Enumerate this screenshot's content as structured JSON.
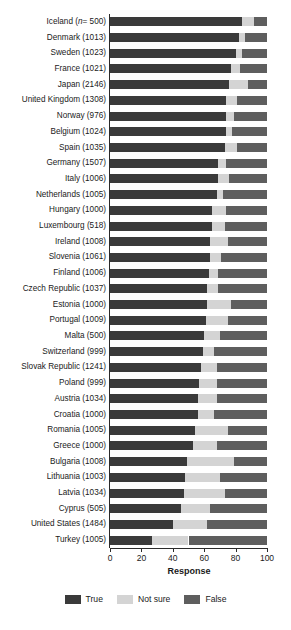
{
  "chart_data": {
    "type": "bar",
    "subtype": "stacked-horizontal-100pct",
    "title": "",
    "xlabel": "Response",
    "ylabel": "",
    "xlim": [
      0,
      100
    ],
    "xticks": [
      "0",
      "20",
      "40",
      "60",
      "80",
      "100"
    ],
    "grid": false,
    "legend_position": "bottom",
    "orientation": "horizontal",
    "series": [
      {
        "name": "True",
        "key": "true",
        "color": "#3a3a3a"
      },
      {
        "name": "Not sure",
        "key": "not_sure",
        "color": "#d4d4d4"
      },
      {
        "name": "False",
        "key": "false",
        "color": "#5e5e5e"
      }
    ],
    "categories": [
      "Iceland (n= 500)",
      "Denmark (1013)",
      "Sweden (1023)",
      "France (1021)",
      "Japan (2146)",
      "United Kingdom (1308)",
      "Norway (976)",
      "Belgium (1024)",
      "Spain (1035)",
      "Germany (1507)",
      "Italy (1006)",
      "Netherlands (1005)",
      "Hungary (1000)",
      "Luxembourg (518)",
      "Ireland (1008)",
      "Slovenia (1061)",
      "Finland (1006)",
      "Czech Republic (1037)",
      "Estonia (1000)",
      "Portugal (1009)",
      "Malta (500)",
      "Switzerland (999)",
      "Slovak Republic (1241)",
      "Poland (999)",
      "Austria (1034)",
      "Croatia (1000)",
      "Romania (1005)",
      "Greece (1000)",
      "Bulgaria (1008)",
      "Lithuania (1003)",
      "Latvia (1034)",
      "Cyprus (505)",
      "United States (1484)",
      "Turkey (1005)"
    ],
    "rows": [
      {
        "label": "Iceland (n= 500)",
        "country": "Iceland",
        "n": "500",
        "true": 84,
        "not_sure": 8,
        "false": 8
      },
      {
        "label": "Denmark (1013)",
        "country": "Denmark",
        "n": "1013",
        "true": 82,
        "not_sure": 4,
        "false": 14
      },
      {
        "label": "Sweden (1023)",
        "country": "Sweden",
        "n": "1023",
        "true": 80,
        "not_sure": 4,
        "false": 16
      },
      {
        "label": "France (1021)",
        "country": "France",
        "n": "1021",
        "true": 77,
        "not_sure": 6,
        "false": 17
      },
      {
        "label": "Japan (2146)",
        "country": "Japan",
        "n": "2146",
        "true": 76,
        "not_sure": 12,
        "false": 12
      },
      {
        "label": "United Kingdom (1308)",
        "country": "United Kingdom",
        "n": "1308",
        "true": 74,
        "not_sure": 7,
        "false": 19
      },
      {
        "label": "Norway (976)",
        "country": "Norway",
        "n": "976",
        "true": 74,
        "not_sure": 5,
        "false": 21
      },
      {
        "label": "Belgium (1024)",
        "country": "Belgium",
        "n": "1024",
        "true": 74,
        "not_sure": 4,
        "false": 22
      },
      {
        "label": "Spain (1035)",
        "country": "Spain",
        "n": "1035",
        "true": 73,
        "not_sure": 8,
        "false": 19
      },
      {
        "label": "Germany (1507)",
        "country": "Germany",
        "n": "1507",
        "true": 69,
        "not_sure": 5,
        "false": 26
      },
      {
        "label": "Italy (1006)",
        "country": "Italy",
        "n": "1006",
        "true": 69,
        "not_sure": 7,
        "false": 24
      },
      {
        "label": "Netherlands (1005)",
        "country": "Netherlands",
        "n": "1005",
        "true": 68,
        "not_sure": 4,
        "false": 28
      },
      {
        "label": "Hungary (1000)",
        "country": "Hungary",
        "n": "1000",
        "true": 65,
        "not_sure": 9,
        "false": 26
      },
      {
        "label": "Luxembourg (518)",
        "country": "Luxembourg",
        "n": "518",
        "true": 65,
        "not_sure": 8,
        "false": 27
      },
      {
        "label": "Ireland (1008)",
        "country": "Ireland",
        "n": "1008",
        "true": 64,
        "not_sure": 11,
        "false": 25
      },
      {
        "label": "Slovenia (1061)",
        "country": "Slovenia",
        "n": "1061",
        "true": 64,
        "not_sure": 7,
        "false": 29
      },
      {
        "label": "Finland (1006)",
        "country": "Finland",
        "n": "1006",
        "true": 63,
        "not_sure": 6,
        "false": 31
      },
      {
        "label": "Czech Republic (1037)",
        "country": "Czech Republic",
        "n": "1037",
        "true": 62,
        "not_sure": 7,
        "false": 31
      },
      {
        "label": "Estonia (1000)",
        "country": "Estonia",
        "n": "1000",
        "true": 62,
        "not_sure": 15,
        "false": 23
      },
      {
        "label": "Portugal (1009)",
        "country": "Portugal",
        "n": "1009",
        "true": 61,
        "not_sure": 14,
        "false": 25
      },
      {
        "label": "Malta (500)",
        "country": "Malta",
        "n": "500",
        "true": 60,
        "not_sure": 10,
        "false": 30
      },
      {
        "label": "Switzerland (999)",
        "country": "Switzerland",
        "n": "999",
        "true": 59,
        "not_sure": 7,
        "false": 34
      },
      {
        "label": "Slovak Republic (1241)",
        "country": "Slovak Republic",
        "n": "1241",
        "true": 58,
        "not_sure": 10,
        "false": 32
      },
      {
        "label": "Poland (999)",
        "country": "Poland",
        "n": "999",
        "true": 57,
        "not_sure": 11,
        "false": 32
      },
      {
        "label": "Austria (1034)",
        "country": "Austria",
        "n": "1034",
        "true": 56,
        "not_sure": 12,
        "false": 32
      },
      {
        "label": "Croatia (1000)",
        "country": "Croatia",
        "n": "1000",
        "true": 56,
        "not_sure": 10,
        "false": 34
      },
      {
        "label": "Romania (1005)",
        "country": "Romania",
        "n": "1005",
        "true": 54,
        "not_sure": 21,
        "false": 25
      },
      {
        "label": "Greece (1000)",
        "country": "Greece",
        "n": "1000",
        "true": 53,
        "not_sure": 15,
        "false": 32
      },
      {
        "label": "Bulgaria (1008)",
        "country": "Bulgaria",
        "n": "1008",
        "true": 49,
        "not_sure": 30,
        "false": 21
      },
      {
        "label": "Lithuania (1003)",
        "country": "Lithuania",
        "n": "1003",
        "true": 48,
        "not_sure": 22,
        "false": 30
      },
      {
        "label": "Latvia (1034)",
        "country": "Latvia",
        "n": "1034",
        "true": 47,
        "not_sure": 26,
        "false": 27
      },
      {
        "label": "Cyprus (505)",
        "country": "Cyprus",
        "n": "505",
        "true": 45,
        "not_sure": 19,
        "false": 36
      },
      {
        "label": "United States (1484)",
        "country": "United States",
        "n": "1484",
        "true": 40,
        "not_sure": 22,
        "false": 38
      },
      {
        "label": "Turkey (1005)",
        "country": "Turkey",
        "n": "1005",
        "true": 27,
        "not_sure": 23,
        "false": 50
      }
    ]
  },
  "axis": {
    "x_title": "Response",
    "ticks": [
      "0",
      "20",
      "40",
      "60",
      "80",
      "100"
    ]
  },
  "legend": {
    "items": [
      {
        "label": "True",
        "color": "#3a3a3a"
      },
      {
        "label": "Not sure",
        "color": "#d4d4d4"
      },
      {
        "label": "False",
        "color": "#5e5e5e"
      }
    ]
  }
}
